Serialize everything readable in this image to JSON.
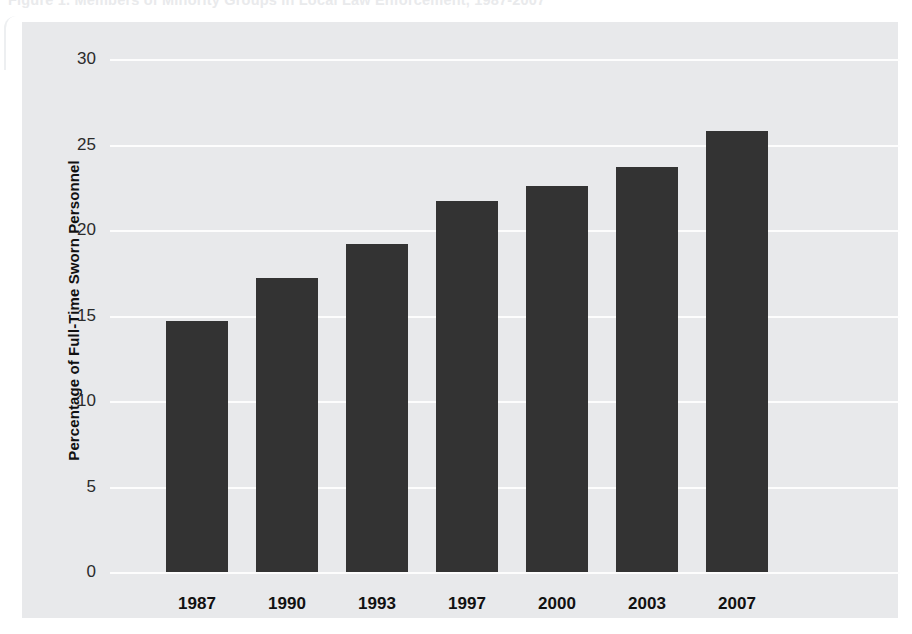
{
  "figure": {
    "title": "Figure 1. Members of Minority Groups in Local Law Enforcement, 1987-2007"
  },
  "chart_data": {
    "type": "bar",
    "title": "Members of Minority Groups in Local Law Enforcement",
    "xlabel": "",
    "ylabel": "Percentage of Full-Time Sworn Personnel",
    "categories": [
      "1987",
      "1990",
      "1993",
      "1997",
      "2000",
      "2003",
      "2007"
    ],
    "values": [
      14.7,
      17.2,
      19.2,
      21.7,
      22.6,
      23.7,
      25.8
    ],
    "ylim": [
      0,
      30
    ],
    "yticks": [
      0,
      5,
      10,
      15,
      20,
      25,
      30
    ],
    "ytick_labels": [
      "0",
      "5",
      "10",
      "15",
      "20",
      "25",
      "30"
    ],
    "grid": true,
    "legend": "none",
    "bar_color": "#333333",
    "plot_background": "#e8e9eb",
    "gridline_color": "#fdfdfd"
  }
}
